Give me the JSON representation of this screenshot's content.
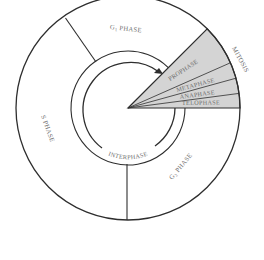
{
  "diagram": {
    "colors": {
      "line": "#2e2e2e",
      "mitosis_fill": "#d4d4d4",
      "label": "#6e6e6e",
      "background": "#ffffff"
    },
    "phases": {
      "g1": {
        "label_main": "G",
        "label_sub": "1",
        "label_rest": " PHASE"
      },
      "s": {
        "label": "S PHASE"
      },
      "g2": {
        "label_main": "G",
        "label_sub": "2",
        "label_rest": " PHASE"
      },
      "mitosis": {
        "label": "MITOSIS"
      },
      "interphase": {
        "label": "INTERPHASE"
      }
    },
    "mitosis_stages": [
      {
        "label": "PROPHASE"
      },
      {
        "label": "METAPHASE"
      },
      {
        "label": "ANAPHASE"
      },
      {
        "label": "TELOPHASE"
      }
    ]
  }
}
